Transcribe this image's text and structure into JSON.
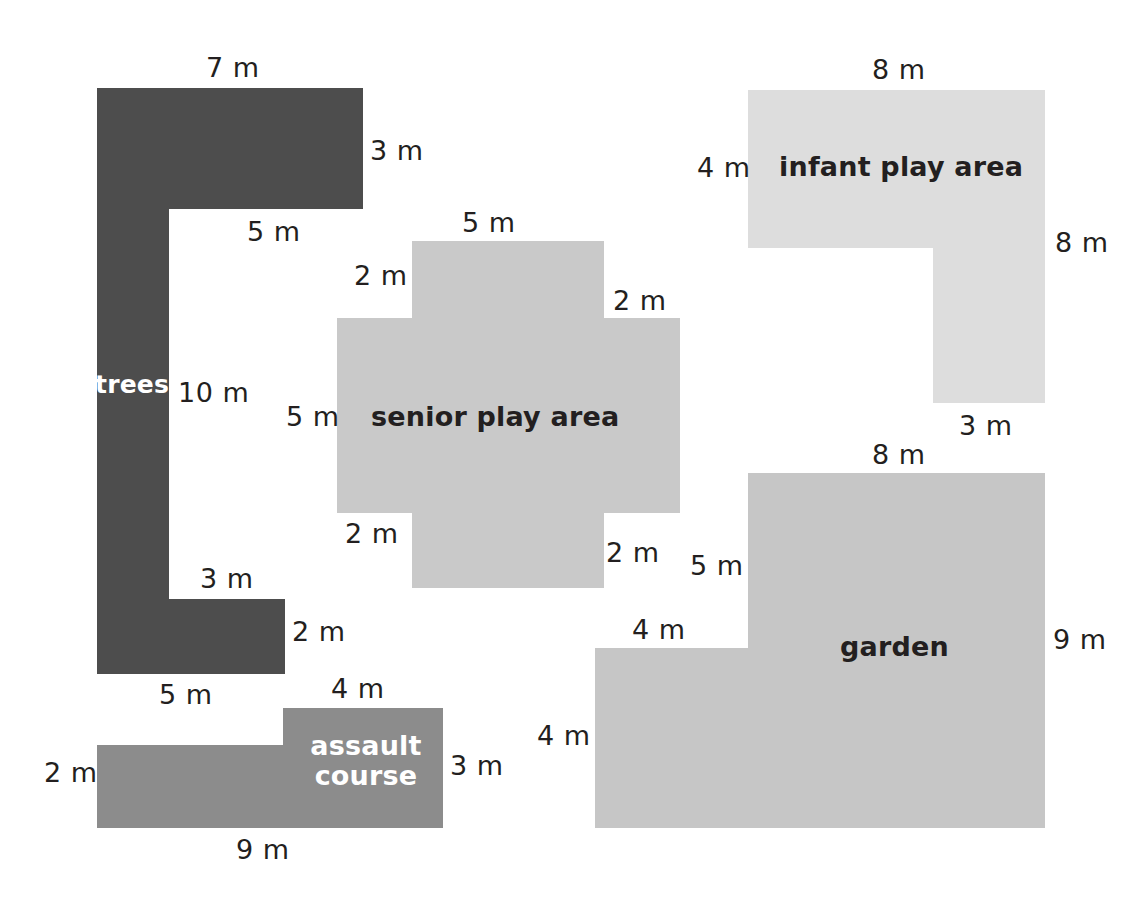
{
  "page": {
    "background": "#ffffff",
    "width": 1145,
    "height": 911
  },
  "palette": {
    "trees": "#4d4d4d",
    "assault_course": "#8c8c8c",
    "senior_play_area": "#c9c9c9",
    "infant_play_area": "#dddddd",
    "garden": "#c6c6c6",
    "label_dark": "#231f20",
    "label_light": "#ffffff"
  },
  "shapes": [
    {
      "id": "trees",
      "label": "trees",
      "label_color": "light",
      "fill": "#4d4d4d",
      "dimensions": [
        {
          "value": "7 m",
          "side": "top"
        },
        {
          "value": "3 m",
          "side": "right-upper"
        },
        {
          "value": "5 m",
          "side": "inner-top"
        },
        {
          "value": "10 m",
          "side": "inner-left"
        },
        {
          "value": "3 m",
          "side": "inner-bottom"
        },
        {
          "value": "2 m",
          "side": "right-lower"
        },
        {
          "value": "5 m",
          "side": "bottom"
        }
      ]
    },
    {
      "id": "senior-play-area",
      "label": "senior play area",
      "label_color": "dark",
      "fill": "#c9c9c9",
      "dimensions": [
        {
          "value": "5 m",
          "side": "top"
        },
        {
          "value": "2 m",
          "side": "top-left-step"
        },
        {
          "value": "2 m",
          "side": "top-right-step"
        },
        {
          "value": "5 m",
          "side": "left"
        },
        {
          "value": "2 m",
          "side": "bottom-left-step"
        },
        {
          "value": "2 m",
          "side": "bottom-right-step"
        }
      ]
    },
    {
      "id": "infant-play-area",
      "label": "infant play area",
      "label_color": "dark",
      "fill": "#dddddd",
      "dimensions": [
        {
          "value": "8 m",
          "side": "top"
        },
        {
          "value": "4 m",
          "side": "left"
        },
        {
          "value": "8 m",
          "side": "right"
        },
        {
          "value": "3 m",
          "side": "bottom"
        }
      ]
    },
    {
      "id": "garden",
      "label": "garden",
      "label_color": "dark",
      "fill": "#c6c6c6",
      "dimensions": [
        {
          "value": "8 m",
          "side": "top"
        },
        {
          "value": "5 m",
          "side": "upper-left"
        },
        {
          "value": "4 m",
          "side": "inner-step-top"
        },
        {
          "value": "4 m",
          "side": "lower-left"
        },
        {
          "value": "9 m",
          "side": "right"
        }
      ]
    },
    {
      "id": "assault-course",
      "label_line1": "assault",
      "label_line2": "course",
      "label_color": "light",
      "fill": "#8c8c8c",
      "dimensions": [
        {
          "value": "4 m",
          "side": "top-right-step"
        },
        {
          "value": "3 m",
          "side": "right"
        },
        {
          "value": "2 m",
          "side": "left"
        },
        {
          "value": "9 m",
          "side": "bottom"
        }
      ]
    }
  ],
  "labels": {
    "trees_name": "trees",
    "senior_name": "senior play area",
    "infant_name": "infant play area",
    "garden_name": "garden",
    "assault_name_line1": "assault",
    "assault_name_line2": "course",
    "trees_top_7m": "7 m",
    "trees_right_3m": "3 m",
    "trees_inner_5m": "5 m",
    "trees_inner_10m": "10 m",
    "trees_inner_3m": "3 m",
    "trees_right_2m": "2 m",
    "trees_bottom_5m": "5 m",
    "senior_top_5m": "5 m",
    "senior_tl_2m": "2 m",
    "senior_tr_2m": "2 m",
    "senior_left_5m": "5 m",
    "senior_bl_2m": "2 m",
    "senior_br_2m": "2 m",
    "infant_top_8m": "8 m",
    "infant_left_4m": "4 m",
    "infant_right_8m": "8 m",
    "infant_bottom_3m": "3 m",
    "garden_top_8m": "8 m",
    "garden_upper_left_5m": "5 m",
    "garden_step_4m": "4 m",
    "garden_lower_left_4m": "4 m",
    "garden_right_9m": "9 m",
    "assault_top_4m": "4 m",
    "assault_right_3m": "3 m",
    "assault_left_2m": "2 m",
    "assault_bottom_9m": "9 m"
  }
}
